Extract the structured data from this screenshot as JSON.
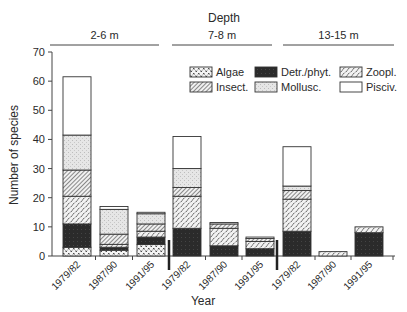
{
  "chart_data": {
    "type": "bar",
    "stacked": true,
    "title": "Depth",
    "xlabel": "Year",
    "ylabel": "Number of species",
    "ylim": [
      0,
      70
    ],
    "yticks": [
      0,
      10,
      20,
      30,
      40,
      50,
      60,
      70
    ],
    "grid": false,
    "legend_position": "upper right (inside plot)",
    "groups": [
      {
        "label": "2-6 m",
        "categories": [
          "1979/82",
          "1987/90",
          "1991/95"
        ]
      },
      {
        "label": "7-8 m",
        "categories": [
          "1979/82",
          "1987/90",
          "1991/95"
        ]
      },
      {
        "label": "13-15 m",
        "categories": [
          "1979/82",
          "1987/90",
          "1991/95"
        ]
      }
    ],
    "categories": [
      "1979/82",
      "1987/90",
      "1991/95",
      "1979/82",
      "1987/90",
      "1991/95",
      "1979/82",
      "1987/90",
      "1991/95"
    ],
    "series": [
      {
        "name": "Algae",
        "pattern": "dotted-cross",
        "values": [
          3,
          2,
          4,
          0,
          0,
          0,
          0,
          0,
          0
        ]
      },
      {
        "name": "Detr./phyt.",
        "pattern": "solid-dark",
        "values": [
          8,
          1,
          2.5,
          9.5,
          3.5,
          2.5,
          8.5,
          0,
          8
        ]
      },
      {
        "name": "Zoopl.",
        "pattern": "dashed-hatch",
        "values": [
          9.5,
          1,
          2,
          11,
          6,
          2.5,
          11,
          1.5,
          2
        ]
      },
      {
        "name": "Insect.",
        "pattern": "diagonal-hatch",
        "values": [
          9,
          3.5,
          2.5,
          3,
          1.5,
          1,
          3,
          0,
          0
        ]
      },
      {
        "name": "Mollusc.",
        "pattern": "light-stipple",
        "values": [
          12,
          8.5,
          3.5,
          6.5,
          0,
          0,
          1.5,
          0,
          0
        ]
      },
      {
        "name": "Pisciv.",
        "pattern": "white",
        "values": [
          20,
          1,
          0.5,
          11,
          0.5,
          0.5,
          13.5,
          0,
          0
        ]
      }
    ],
    "totals": [
      61.5,
      17,
      15,
      41,
      11.5,
      7,
      37.5,
      1.5,
      10
    ]
  },
  "labels": {
    "title": "Depth",
    "xlabel": "Year",
    "ylabel": "Number of species",
    "legend": [
      "Algae",
      "Detr./phyt.",
      "Zoopl.",
      "Insect.",
      "Mollusc.",
      "Pisciv."
    ]
  }
}
